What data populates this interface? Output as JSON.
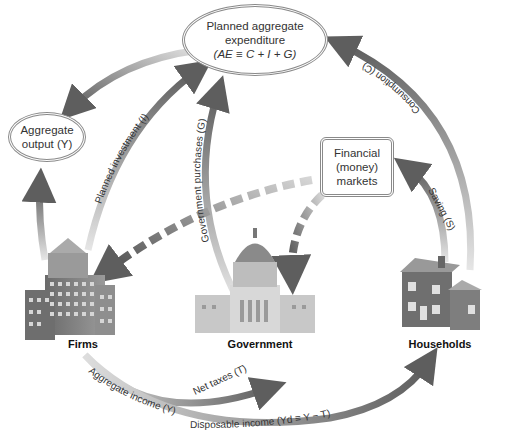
{
  "nodes": {
    "planned_ae": {
      "line1": "Planned aggregate",
      "line2": "expenditure",
      "line3": "(AE ≡ C + I + G)"
    },
    "aggregate_output": {
      "line1": "Aggregate",
      "line2": "output (Y)"
    },
    "financial_markets": {
      "line1": "Financial",
      "line2": "(money)",
      "line3": "markets"
    }
  },
  "sectors": {
    "firms": "Firms",
    "government": "Government",
    "households": "Households"
  },
  "flows": {
    "planned_investment": "Planned investment (I)",
    "government_purchases": "Government purchases (G)",
    "consumption": "Consumption (C)",
    "saving": "Saving (S)",
    "net_taxes": "Net taxes (T)",
    "aggregate_income": "Aggregate income (Y)",
    "disposable_income": "Disposable income (Yd ≡ Y − T)"
  },
  "colors": {
    "arrow_dark": "#5e5e5e",
    "arrow_light": "#c8c8c8",
    "node_border": "#8a8a8a",
    "building": "#7a7a7a"
  }
}
